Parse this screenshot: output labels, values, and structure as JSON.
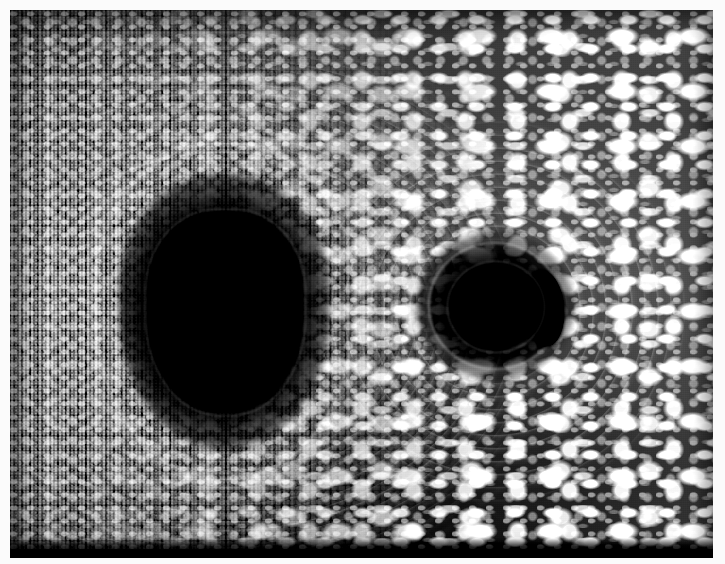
{
  "figure": {
    "kind": "scientific-visualization",
    "medium": "grayscale raster photograph / simulation frame",
    "caption": "",
    "border": {
      "color": "#fbfbfb",
      "inset_px": 10
    },
    "canvas": {
      "width_px": 725,
      "height_px": 564,
      "plate_width_px": 703,
      "plate_height_px": 548
    }
  },
  "palette": {
    "shadow_black": "#000000",
    "deep_sky": "#0a0a0a",
    "mid_sky": "#2c2c2c",
    "bright_sky": "#565656",
    "star_white": "#ffffff",
    "frame_white": "#fbfbfb",
    "bottom_strip": "#0d0d0d"
  },
  "objects": [
    {
      "name": "primary-black-hole",
      "label": "Primary black hole shadow",
      "shape": "rounded-rectangular oval",
      "center_pct": {
        "x": 30.5,
        "y": 55.0
      },
      "size_pct": {
        "w": 21.5,
        "h": 35.5
      },
      "fill": "#000000"
    },
    {
      "name": "secondary-black-hole",
      "label": "Secondary black hole shadow",
      "shape": "circle",
      "center_pct": {
        "x": 69.0,
        "y": 54.0
      },
      "size_pct": {
        "w": 12.4,
        "h": 15.0
      },
      "fill": "#000000"
    },
    {
      "name": "secondary-crescent",
      "label": "Crescent counter-image of secondary",
      "shape": "crescent",
      "center_pct": {
        "x": 76.5,
        "y": 54.5
      },
      "size_pct": {
        "w": 4.6,
        "h": 13.6
      },
      "fill": "#000000"
    }
  ],
  "features": {
    "star_field": "Dense background star field, strongly sheared into tangential streaks by gravitational lensing",
    "left_region": "Highly magnified, compressed fine-grained star speckle (low surface brightness)",
    "right_region": "Sparser, larger and brighter lensed star images on a medium-grey sky",
    "arcs": "Concentric Einstein-ring arcs encircling both shadows, strongest in the gap between them",
    "bottom_edge": "Dark horizontal strip along the lower margin of the plate"
  },
  "annotations": []
}
